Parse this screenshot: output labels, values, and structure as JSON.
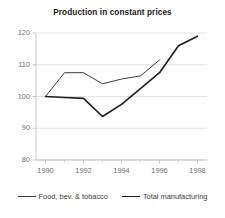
{
  "chart_data": {
    "type": "line",
    "title": "Production in constant prices",
    "xlabel": "",
    "ylabel": "",
    "x": [
      1990,
      1991,
      1992,
      1993,
      1994,
      1995,
      1996,
      1997,
      1998
    ],
    "xlim": [
      1989.5,
      1998.5
    ],
    "ylim": [
      80,
      120
    ],
    "yticks": [
      80,
      90,
      100,
      110,
      120
    ],
    "xticks": [
      1990,
      1992,
      1994,
      1996,
      1998
    ],
    "xminorticks": [
      1991,
      1993,
      1995,
      1997
    ],
    "grid": "horizontal",
    "legend_position": "bottom",
    "series": [
      {
        "name": "Food, bev. & tobacco",
        "x": [
          1990,
          1991,
          1992,
          1993,
          1994,
          1995,
          1996
        ],
        "values": [
          100.0,
          107.5,
          107.5,
          104.0,
          105.5,
          106.5,
          111.5
        ],
        "color": "#3d3d3d",
        "width": 1.0
      },
      {
        "name": "Total manufacturing",
        "x": [
          1990,
          1991,
          1992,
          1993,
          1994,
          1995,
          1996,
          1997,
          1998
        ],
        "values": [
          100.0,
          99.7,
          99.4,
          93.7,
          97.5,
          102.5,
          107.5,
          116.0,
          119.0
        ],
        "color": "#1c1c1c",
        "width": 1.6
      }
    ]
  },
  "axis": {
    "ytick_labels": [
      "120",
      "110",
      "100",
      "90",
      "80"
    ],
    "xtick_labels": [
      "1990",
      "1992",
      "1994",
      "1996",
      "1998"
    ]
  },
  "legend": {
    "items": [
      {
        "label": "Food, bev. & tobacco"
      },
      {
        "label": "Total manufacturing"
      }
    ]
  },
  "colors": {
    "grid": "#d8dde3",
    "axis": "#bcc3ca",
    "tick_text": "#6e6e6e",
    "title_text": "#1a1a1a",
    "series_1": "#3d3d3d",
    "series_2": "#1c1c1c"
  }
}
